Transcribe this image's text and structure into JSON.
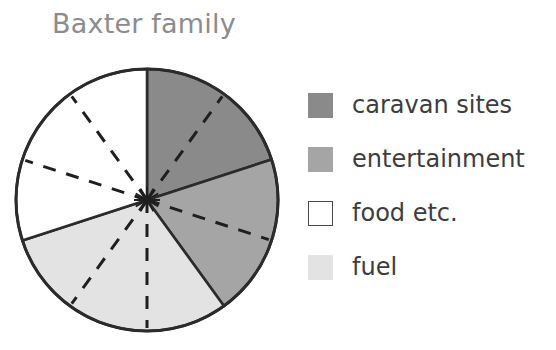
{
  "title": "Baxter family",
  "legend": {
    "items": [
      {
        "label": "caravan sites",
        "color": "#8a8a8a",
        "swatch_style": "filled"
      },
      {
        "label": "entertainment",
        "color": "#a5a5a5",
        "swatch_style": "filled"
      },
      {
        "label": "food etc.",
        "color": "#ffffff",
        "swatch_style": "outlined"
      },
      {
        "label": "fuel",
        "color": "#e3e3e3",
        "swatch_style": "filled"
      }
    ]
  },
  "chart_data": {
    "type": "pie",
    "title": "Baxter family",
    "xlabel": "",
    "ylabel": "",
    "total_segments": 10,
    "segment_angle_deg": 36,
    "legend_position": "right",
    "grid": false,
    "annotations": "Dashed radial lines divide the pie into 10 equal 36-degree units",
    "categories": [
      "caravan sites",
      "entertainment",
      "fuel",
      "food etc."
    ],
    "values": [
      2,
      2,
      3,
      3
    ],
    "percentages": [
      20,
      20,
      30,
      30
    ],
    "colors": [
      "#8a8a8a",
      "#a5a5a5",
      "#e3e3e3",
      "#ffffff"
    ],
    "slices": [
      {
        "label": "caravan sites",
        "units": 2,
        "percent": 20,
        "start_deg": 0,
        "end_deg": 72,
        "color": "#8a8a8a"
      },
      {
        "label": "entertainment",
        "units": 2,
        "percent": 20,
        "start_deg": 72,
        "end_deg": 144,
        "color": "#a5a5a5"
      },
      {
        "label": "fuel",
        "units": 3,
        "percent": 30,
        "start_deg": 144,
        "end_deg": 252,
        "color": "#e3e3e3"
      },
      {
        "label": "food etc.",
        "units": 3,
        "percent": 30,
        "start_deg": 252,
        "end_deg": 360,
        "color": "#ffffff"
      }
    ]
  },
  "geometry": {
    "center_x": 147,
    "center_y": 150,
    "radius": 131,
    "outline_color": "#2b2b2b"
  }
}
